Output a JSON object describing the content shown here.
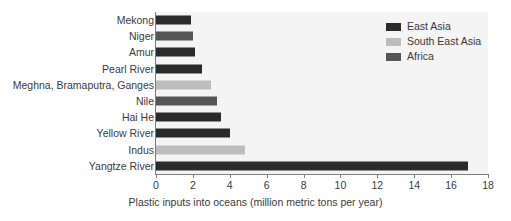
{
  "chart_data": {
    "type": "bar",
    "orientation": "horizontal",
    "title": "",
    "xlabel": "Plastic inputs into oceans (million metric tons per year)",
    "ylabel": "",
    "xlim": [
      0,
      18
    ],
    "xticks": [
      0,
      2,
      4,
      6,
      8,
      10,
      12,
      14,
      16,
      18
    ],
    "grid": false,
    "legend_position": "top-right",
    "categories": [
      "Mekong",
      "Niger",
      "Amur",
      "Pearl River",
      "Meghna, Bramaputra, Ganges",
      "Nile",
      "Hai He",
      "Yellow River",
      "Indus",
      "Yangtze River"
    ],
    "values": [
      1.9,
      2.0,
      2.1,
      2.5,
      3.0,
      3.3,
      3.5,
      4.0,
      4.8,
      16.9
    ],
    "group_of_category": [
      "East Asia",
      "Africa",
      "East Asia",
      "East Asia",
      "South East Asia",
      "Africa",
      "East Asia",
      "East Asia",
      "South East Asia",
      "East Asia"
    ],
    "legend": [
      {
        "label": "East Asia",
        "color": "#2b2b2b"
      },
      {
        "label": "South East Asia",
        "color": "#bdbdbd"
      },
      {
        "label": "Africa",
        "color": "#555555"
      }
    ]
  },
  "colors": {
    "plot_background": "#f4f4f4",
    "axis": "#7d7d7d",
    "text": "#3a3a3a",
    "east_asia": "#2b2b2b",
    "south_east_asia": "#bdbdbd",
    "africa": "#555555"
  }
}
